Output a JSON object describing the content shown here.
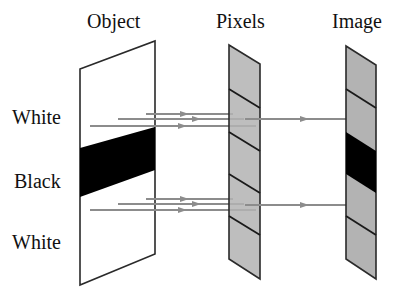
{
  "headers": {
    "object": "Object",
    "pixels": "Pixels",
    "image": "Image"
  },
  "row_labels": {
    "top": "White",
    "middle": "Black",
    "bottom": "White"
  },
  "colors": {
    "outline": "#2a2a2a",
    "strip_fill": "#b3b3b3",
    "black": "#000000",
    "ray": "#8c8c8c",
    "background": "#ffffff"
  },
  "pixels_strip": {
    "segments": 5,
    "segment_colors": [
      "gray",
      "gray",
      "gray",
      "gray",
      "gray"
    ]
  },
  "image_strip": {
    "segments": 5,
    "segment_colors": [
      "gray",
      "gray",
      "black",
      "gray",
      "gray"
    ]
  }
}
